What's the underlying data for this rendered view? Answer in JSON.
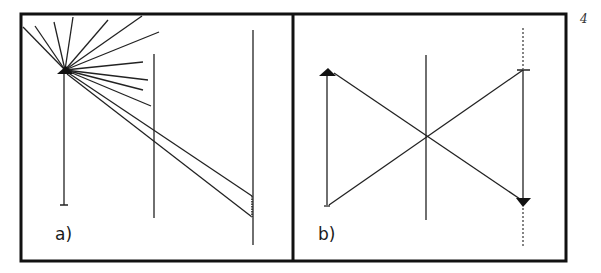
{
  "figure": {
    "page_number": "4",
    "panels": [
      {
        "id": "a",
        "label": "a)",
        "description": "Point source (object arrow tip) emitting rays; a narrow beam passes the middle screen and reaches the right screen"
      },
      {
        "id": "b",
        "label": "b)",
        "description": "Object arrow on the left imaged as an inverted arrow on the right via rays crossing at the middle plane"
      }
    ]
  }
}
